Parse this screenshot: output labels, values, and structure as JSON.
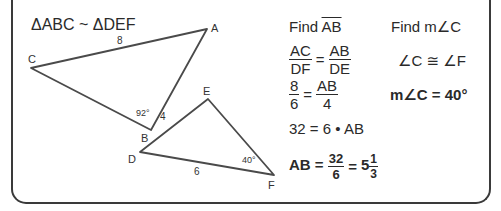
{
  "header": {
    "similarity_statement": "ΔABC ~ ΔDEF"
  },
  "diagram": {
    "triangle_abc": {
      "vertices": {
        "A": [
          207,
          29
        ],
        "B": [
          151,
          130
        ],
        "C": [
          31,
          68
        ]
      },
      "labels": {
        "A": "A",
        "B": "B",
        "C": "C"
      },
      "side_ca_length": "8",
      "side_ab_length": "4",
      "angle_b": "92°"
    },
    "triangle_def": {
      "vertices": {
        "D": [
          140,
          152
        ],
        "E": [
          208,
          99
        ],
        "F": [
          274,
          175
        ]
      },
      "labels": {
        "D": "D",
        "E": "E",
        "F": "F"
      },
      "side_df_length": "6",
      "angle_f": "40°"
    },
    "stroke_color": "#4a4a4a"
  },
  "solution_ab": {
    "heading_prefix": "Find ",
    "heading_segment": "AB",
    "proportion": {
      "left_num": "AC",
      "left_den": "DF",
      "equals": "=",
      "right_num": "AB",
      "right_den": "DE"
    },
    "substitution": {
      "left_num": "8",
      "left_den": "6",
      "equals": "=",
      "right_num": "AB",
      "right_den": "4"
    },
    "cross_multiply": "32 = 6 • AB",
    "result": {
      "lhs": "AB =",
      "frac_num": "32",
      "frac_den": "6",
      "equals": "=",
      "whole": "5",
      "mixed_num": "1",
      "mixed_den": "3"
    }
  },
  "solution_c": {
    "heading": "Find m∠C",
    "congruence": "∠C ≅ ∠F",
    "result": "m∠C = 40°"
  }
}
